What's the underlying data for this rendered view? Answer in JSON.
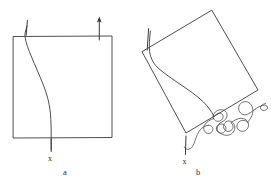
{
  "figure": {
    "background_color": "#ffffff",
    "ink_color": "#3b3b3b",
    "panels": [
      {
        "id": "a",
        "caption": "a",
        "caption_position": {
          "x": 65,
          "y": 174
        },
        "point_label": "x",
        "point_label_position": {
          "x": 49,
          "y": 160
        },
        "description": "upright square with curved line",
        "square": {
          "type": "axis-aligned-square",
          "corners": [
            {
              "x": 13,
              "y": 36
            },
            {
              "x": 112,
              "y": 36
            },
            {
              "x": 112,
              "y": 138
            },
            {
              "x": 13,
              "y": 138
            }
          ]
        },
        "curve": {
          "type": "open-curve",
          "points": [
            {
              "x": 27,
              "y": 26
            },
            {
              "x": 25,
              "y": 36
            },
            {
              "x": 30,
              "y": 54
            },
            {
              "x": 38,
              "y": 72
            },
            {
              "x": 46,
              "y": 93
            },
            {
              "x": 50,
              "y": 113
            },
            {
              "x": 51,
              "y": 138
            },
            {
              "x": 51,
              "y": 150
            }
          ]
        },
        "ticks": [
          {
            "name": "top-left-tick",
            "x1": 27,
            "y1": 21,
            "x2": 26,
            "y2": 35
          },
          {
            "name": "bottom-x-tick",
            "x1": 51,
            "y1": 139,
            "x2": 51,
            "y2": 151
          }
        ],
        "arrow": {
          "name": "up-arrow",
          "x": 99,
          "y_tail": 40,
          "y_head": 18,
          "direction": "up"
        }
      },
      {
        "id": "b",
        "caption": "b",
        "caption_position": {
          "x": 197,
          "y": 174
        },
        "point_label": "x",
        "point_label_position": {
          "x": 184,
          "y": 163
        },
        "description": "rotated square with curved line ending in tangled coil",
        "square": {
          "type": "rotated-square",
          "rotation_degrees": -35,
          "corners": [
            {
              "x": 212,
              "y": 10
            },
            {
              "x": 258,
              "y": 90
            },
            {
              "x": 186,
              "y": 133
            },
            {
              "x": 142,
              "y": 52
            }
          ]
        },
        "curve": {
          "type": "open-curve",
          "points": [
            {
              "x": 150,
              "y": 32
            },
            {
              "x": 150,
              "y": 56
            },
            {
              "x": 163,
              "y": 70
            },
            {
              "x": 180,
              "y": 83
            },
            {
              "x": 196,
              "y": 97
            },
            {
              "x": 208,
              "y": 110
            },
            {
              "x": 214,
              "y": 117
            }
          ]
        },
        "coil": {
          "type": "tangled-squiggle",
          "description": "randomly coiled chain at lower right of rotated square"
        },
        "ticks": [
          {
            "name": "upper-left-tick",
            "x1": 148,
            "y1": 29,
            "x2": 147,
            "y2": 50
          },
          {
            "name": "bottom-x-tick",
            "x1": 186,
            "y1": 136,
            "x2": 186,
            "y2": 154
          }
        ]
      }
    ]
  }
}
